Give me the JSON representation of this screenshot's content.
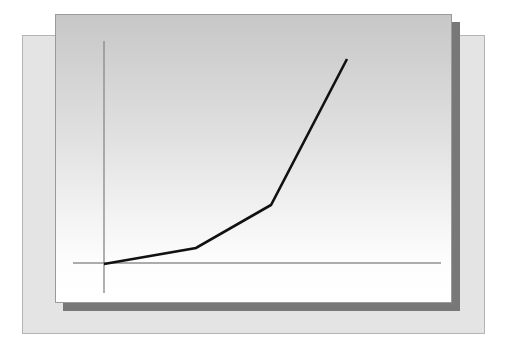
{
  "canvas": {
    "width": 508,
    "height": 357,
    "background_color": "#ffffff"
  },
  "back_card": {
    "name": "background-panel",
    "fill_color": "#e4e4e4",
    "border_color": "#b4b4b4",
    "x": 22,
    "y": 35,
    "width": 463,
    "height": 299
  },
  "front_card": {
    "name": "chart-panel",
    "gradient_top_color": "#c7c7c7",
    "gradient_bottom_color": "#ffffff",
    "border_color": "#9a9a9a",
    "shadow_color": "#787878",
    "shadow_offset_x": 8,
    "shadow_offset_y": 8,
    "x": 55,
    "y": 14,
    "width": 397,
    "height": 289
  },
  "chart_data": {
    "type": "line",
    "title": "",
    "subtitle": "",
    "xlabel": "",
    "ylabel": "",
    "grid": false,
    "legend": null,
    "tick_labels_x": [],
    "tick_labels_y": [],
    "annotations": [],
    "axis_color": "#8f8f8f",
    "line_color": "#111111",
    "line_width": 2.6,
    "xlim": [
      0,
      10
    ],
    "ylim": [
      0,
      10
    ],
    "series": [
      {
        "name": "growth",
        "x": [
          0,
          2.72,
          4.86,
          7.03
        ],
        "y": [
          0,
          0.71,
          2.62,
          9.11
        ]
      }
    ],
    "pixel_geometry": {
      "y_axis_x": 48,
      "y_axis_top": 26,
      "y_axis_bottom": 278,
      "x_axis_y": 248,
      "x_axis_left": 17,
      "x_axis_right": 385,
      "line_points": [
        [
          48,
          249
        ],
        [
          140,
          233
        ],
        [
          215,
          190
        ],
        [
          291,
          44
        ]
      ]
    }
  }
}
